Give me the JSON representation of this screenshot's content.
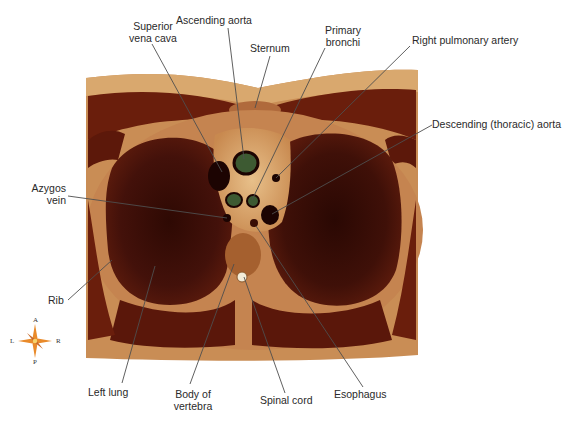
{
  "figure": {
    "type": "anatomical cross-section",
    "colors": {
      "background": "#ffffff",
      "muscle": "#6a1e0c",
      "lung": "#3c0d05",
      "fat_tissue": "#d9a46a",
      "skin": "#c98d55",
      "vessel_green": "#3d5a32",
      "leader_line": "#555555",
      "label_text": "#2a2a2a"
    }
  },
  "labels": {
    "superior_vena_cava": "Superior\nvena cava",
    "superior_vena_cava_l1": "Superior",
    "superior_vena_cava_l2": "vena cava",
    "ascending_aorta": "Ascending aorta",
    "sternum": "Sternum",
    "primary_bronchi_l1": "Primary",
    "primary_bronchi_l2": "bronchi",
    "right_pulmonary_artery": "Right pulmonary artery",
    "descending_aorta": "Descending (thoracic) aorta",
    "azygos_vein_l1": "Azygos",
    "azygos_vein_l2": "vein",
    "rib": "Rib",
    "left_lung": "Left lung",
    "body_of_vertebra_l1": "Body of",
    "body_of_vertebra_l2": "vertebra",
    "spinal_cord": "Spinal cord",
    "esophagus": "Esophagus"
  },
  "compass": {
    "top": "A",
    "bottom": "P",
    "left": "L",
    "right": "R"
  }
}
